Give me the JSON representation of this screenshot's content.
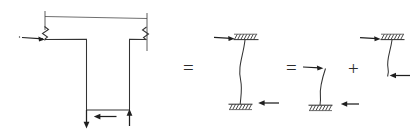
{
  "figure": {
    "kind": "engineering-hand-sketch",
    "background_color": "#ffffff",
    "ink_color": "#333333",
    "accent_color": "#1f1f1f",
    "width": 420,
    "height": 132
  },
  "operators": {
    "equals_1": "=",
    "equals_2": "=",
    "plus": "+"
  },
  "panels": [
    {
      "id": "panel-frame",
      "name": "t-shaped-frame",
      "label": "",
      "support_type": "spring",
      "member_shape": "tee",
      "loads": [
        {
          "name": "horizontal-load-left",
          "direction": "right",
          "position": "top-left-joint"
        },
        {
          "name": "vertical-load-down",
          "direction": "down",
          "position": "base-left"
        },
        {
          "name": "horizontal-load-base",
          "direction": "left",
          "position": "base-middle"
        },
        {
          "name": "vertical-load-up",
          "direction": "up",
          "position": "base-right"
        }
      ],
      "annotations": [
        {
          "name": "span-dimension-line",
          "kind": "dimension",
          "value": ""
        },
        {
          "name": "spring-symbol-left",
          "kind": "zigzag",
          "value": ""
        },
        {
          "name": "spring-symbol-right",
          "kind": "zigzag",
          "value": ""
        }
      ]
    },
    {
      "id": "panel-deflected-column",
      "name": "deflected-column-combined",
      "label": "",
      "support_type": "fixed",
      "member_shape": "curved-column",
      "loads": [
        {
          "name": "horizontal-load-top",
          "direction": "right",
          "position": "top"
        },
        {
          "name": "horizontal-load-bottom",
          "direction": "left",
          "position": "bottom"
        }
      ],
      "annotations": [
        {
          "name": "fixed-support-top",
          "kind": "hatched-support",
          "value": ""
        },
        {
          "name": "fixed-support-bottom",
          "kind": "hatched-support",
          "value": ""
        }
      ]
    },
    {
      "id": "panel-case-a",
      "name": "cantilever-fixed-base",
      "label": "",
      "support_type": "fixed-base",
      "member_shape": "curved-column",
      "loads": [
        {
          "name": "horizontal-load-top",
          "direction": "right",
          "position": "free-end-top"
        },
        {
          "name": "horizontal-load-bottom",
          "direction": "left",
          "position": "base"
        }
      ],
      "annotations": [
        {
          "name": "fixed-support-bottom",
          "kind": "hatched-support",
          "value": ""
        }
      ]
    },
    {
      "id": "panel-case-b",
      "name": "cantilever-fixed-head",
      "label": "",
      "support_type": "fixed-head",
      "member_shape": "curved-column",
      "loads": [
        {
          "name": "horizontal-load-top",
          "direction": "right",
          "position": "head"
        },
        {
          "name": "horizontal-load-bottom",
          "direction": "left",
          "position": "free-end-bottom"
        }
      ],
      "annotations": [
        {
          "name": "fixed-support-top",
          "kind": "hatched-support",
          "value": ""
        }
      ]
    }
  ]
}
